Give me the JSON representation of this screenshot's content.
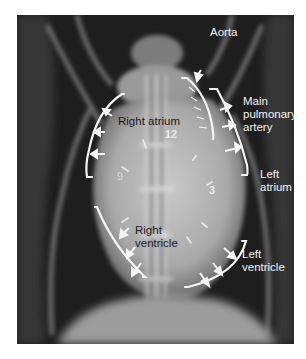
{
  "figure": {
    "type": "ventrodorsal thoracic radiograph with annotated cardiac silhouette (clock-face analogy)",
    "labels": {
      "aorta": "Aorta",
      "main_pulmonary_artery_line1": "Main",
      "main_pulmonary_artery_line2": "pulmonary",
      "main_pulmonary_artery_line3": "artery",
      "right_atrium": "Right atrium",
      "left_atrium_line1": "Left",
      "left_atrium_line2": "atrium",
      "right_ventricle_line1": "Right",
      "right_ventricle_line2": "ventricle",
      "left_ventricle_line1": "Left",
      "left_ventricle_line2": "ventricle"
    },
    "clock_positions": {
      "twelve": "12",
      "three": "3",
      "six": "6",
      "nine": "9"
    },
    "colors": {
      "background": "#ffffff",
      "film_dark": "#1c1c1c",
      "heart_silhouette": "#b8b8b8",
      "annotation": "#f5f5f5"
    }
  }
}
